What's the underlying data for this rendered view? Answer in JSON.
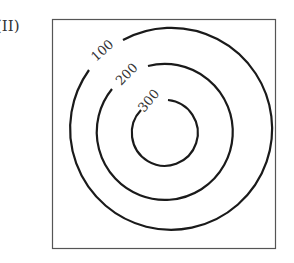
{
  "figure": {
    "label": "(II)",
    "type": "contour map",
    "frame": {
      "x": 52,
      "y": 19,
      "width": 224,
      "height": 230
    },
    "center": {
      "x": 164,
      "y": 133
    },
    "contours": [
      {
        "value": "100",
        "radius": 101
      },
      {
        "value": "200",
        "radius": 68
      },
      {
        "value": "300",
        "radius": 33
      }
    ],
    "colors": {
      "line": "#1a1a1a",
      "frame": "#555555",
      "text": "#333333"
    }
  }
}
